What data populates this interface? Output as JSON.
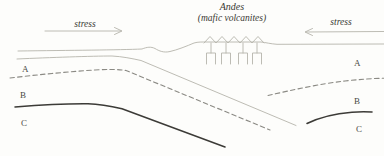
{
  "figure": {
    "title": "Andes",
    "subtitle": "(mafic volcanites)",
    "stress_left": "stress",
    "stress_right": "stress",
    "layer_labels": {
      "left": {
        "a": "A",
        "b": "B",
        "c": "C"
      },
      "right": {
        "a": "A",
        "b": "B",
        "c": "C"
      }
    },
    "colors": {
      "background": "#fdfdfb",
      "light_line": "#b6b4ac",
      "dashed_line": "#8b8a84",
      "dark_line": "#3c3b37",
      "text": "#3a3933"
    }
  }
}
